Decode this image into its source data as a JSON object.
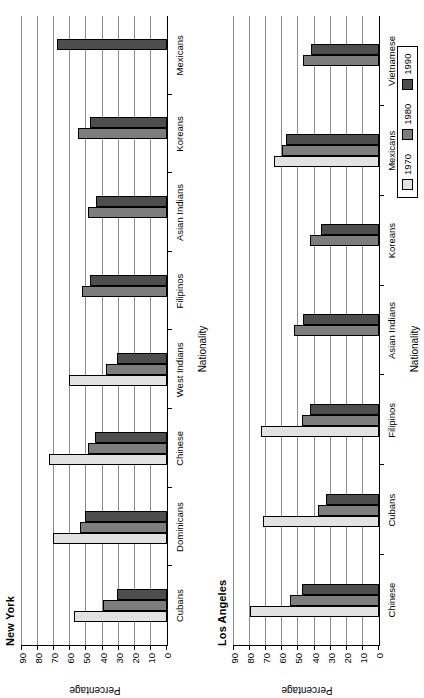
{
  "figure": {
    "orientation": "rotated-90-ccw",
    "background": "#ffffff"
  },
  "legend": {
    "position": "bottom-right",
    "entries": [
      {
        "label": "1970",
        "color": "#e2e2e2"
      },
      {
        "label": "1980",
        "color": "#7d7d7d"
      },
      {
        "label": "1990",
        "color": "#4d4d4d"
      }
    ]
  },
  "axis": {
    "ylabel": "Percentage",
    "xlabel": "Nationality",
    "yticks": [
      "0",
      "10",
      "20",
      "30",
      "40",
      "50",
      "60",
      "70",
      "80",
      "90"
    ],
    "ymin": 0,
    "ymax": 90
  },
  "panels": [
    {
      "title": "New York"
    },
    {
      "title": "Los Angeles"
    }
  ],
  "chart_data": [
    {
      "type": "bar",
      "title": "New York",
      "xlabel": "Nationality",
      "ylabel": "Percentage",
      "ylim": [
        0,
        90
      ],
      "grid": true,
      "legend_position": "bottom-right",
      "categories": [
        "Cubans",
        "Dominicans",
        "Chinese",
        "West Indians",
        "Filipinos",
        "Asian Indians",
        "Koreans",
        "Mexicans"
      ],
      "series": [
        {
          "name": "1970",
          "values": [
            58,
            71,
            73,
            61,
            null,
            null,
            null,
            null
          ]
        },
        {
          "name": "1980",
          "values": [
            40,
            54,
            49,
            38,
            53,
            49,
            55,
            null
          ]
        },
        {
          "name": "1990",
          "values": [
            31,
            51,
            45,
            31,
            48,
            44,
            48,
            68
          ]
        }
      ]
    },
    {
      "type": "bar",
      "title": "Los Angeles",
      "xlabel": "Nationality",
      "ylabel": "Percentage",
      "ylim": [
        0,
        90
      ],
      "grid": true,
      "legend_position": "bottom-right",
      "categories": [
        "Chinese",
        "Cubans",
        "Filipinos",
        "Asian Indians",
        "Koreans",
        "Mexicans",
        "Vietnamese"
      ],
      "series": [
        {
          "name": "1970",
          "values": [
            80,
            72,
            73,
            null,
            null,
            65,
            null
          ]
        },
        {
          "name": "1980",
          "values": [
            55,
            38,
            48,
            53,
            43,
            60,
            47
          ]
        },
        {
          "name": "1990",
          "values": [
            48,
            33,
            43,
            47,
            36,
            58,
            42
          ]
        }
      ]
    }
  ]
}
